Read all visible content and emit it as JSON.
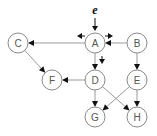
{
  "diagram": {
    "type": "directed-graph",
    "event_label": "e",
    "nodes": [
      {
        "id": "A",
        "label": "A",
        "x": 95,
        "y": 43
      },
      {
        "id": "B",
        "label": "B",
        "x": 137,
        "y": 43
      },
      {
        "id": "C",
        "label": "C",
        "x": 18,
        "y": 43
      },
      {
        "id": "D",
        "label": "D",
        "x": 95,
        "y": 80
      },
      {
        "id": "E",
        "label": "E",
        "x": 137,
        "y": 80
      },
      {
        "id": "F",
        "label": "F",
        "x": 52,
        "y": 80
      },
      {
        "id": "G",
        "label": "G",
        "x": 95,
        "y": 117
      },
      {
        "id": "H",
        "label": "H",
        "x": 137,
        "y": 117
      }
    ],
    "edges": [
      {
        "from": "A",
        "to": "C"
      },
      {
        "from": "B",
        "to": "A"
      },
      {
        "from": "A",
        "to": "D"
      },
      {
        "from": "B",
        "to": "E"
      },
      {
        "from": "C",
        "to": "F"
      },
      {
        "from": "D",
        "to": "F"
      },
      {
        "from": "D",
        "to": "G"
      },
      {
        "from": "D",
        "to": "H"
      },
      {
        "from": "E",
        "to": "G"
      },
      {
        "from": "E",
        "to": "H"
      }
    ],
    "propagation_arrows": [
      {
        "direction": "left",
        "x": 80,
        "y": 36
      },
      {
        "direction": "right",
        "x": 110,
        "y": 36
      },
      {
        "direction": "down",
        "x": 102,
        "y": 61
      }
    ],
    "colors": {
      "node_stroke": "#8a8a8a",
      "edge": "#9a9a9a",
      "arrowhead": "#111111",
      "label": "#555555"
    }
  }
}
